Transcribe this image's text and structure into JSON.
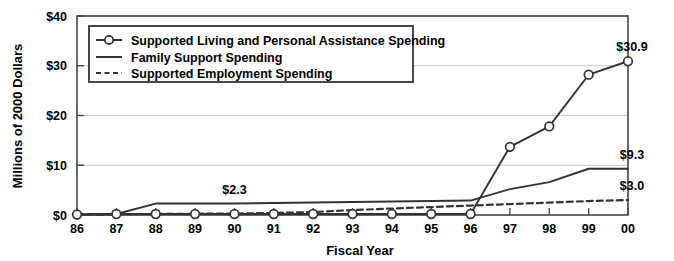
{
  "chart_data": {
    "type": "line",
    "title": "",
    "xlabel": "Fiscal Year",
    "ylabel": "Millions of 2000 Dollars",
    "categories": [
      "86",
      "87",
      "88",
      "89",
      "90",
      "91",
      "92",
      "93",
      "94",
      "95",
      "96",
      "97",
      "98",
      "99",
      "00"
    ],
    "x_tick_labels": [
      "86",
      "87",
      "88",
      "89",
      "90",
      "91",
      "92",
      "93",
      "94",
      "95",
      "96",
      "97",
      "98",
      "99",
      "00"
    ],
    "y_tick_labels": [
      "$0",
      "$10",
      "$20",
      "$30",
      "$40"
    ],
    "y_tick_values": [
      0,
      10,
      20,
      30,
      40
    ],
    "ylim": [
      0,
      40
    ],
    "grid": "horizontal",
    "legend_position": "top-left-inside",
    "series": [
      {
        "name": "Supported Living and Personal Assistance Spending",
        "style": "solid-with-circle-markers",
        "color": "#333333",
        "values": [
          0.1,
          0.2,
          0.2,
          0.2,
          0.2,
          0.2,
          0.2,
          0.2,
          0.2,
          0.2,
          0.2,
          13.7,
          17.8,
          28.2,
          30.9
        ]
      },
      {
        "name": "Family Support Spending",
        "style": "solid",
        "color": "#333333",
        "values": [
          0.1,
          0.2,
          2.3,
          2.3,
          2.3,
          2.4,
          2.5,
          2.6,
          2.7,
          2.8,
          2.9,
          5.2,
          6.6,
          9.3,
          9.3
        ]
      },
      {
        "name": "Supported Employment Spending",
        "style": "dashed",
        "color": "#333333",
        "values": [
          0.1,
          0.15,
          0.2,
          0.25,
          0.3,
          0.4,
          0.6,
          1.0,
          1.3,
          1.6,
          1.9,
          2.2,
          2.5,
          2.8,
          3.0
        ]
      }
    ],
    "annotations": [
      {
        "text": "$2.3",
        "series": "Family Support Spending",
        "category": "90",
        "value": 2.3
      },
      {
        "text": "$30.9",
        "series": "Supported Living and Personal Assistance Spending",
        "category": "00",
        "value": 30.9
      },
      {
        "text": "$9.3",
        "series": "Family Support Spending",
        "category": "00",
        "value": 9.3
      },
      {
        "text": "$3.0",
        "series": "Supported Employment Spending",
        "category": "00",
        "value": 3.0
      }
    ]
  },
  "legend": {
    "items": [
      {
        "label": "Supported Living and Personal Assistance Spending",
        "marker": "line-circle-marker-icon"
      },
      {
        "label": "Family Support Spending",
        "marker": "solid-line-icon"
      },
      {
        "label": "Supported Employment Spending",
        "marker": "dashed-line-icon"
      }
    ]
  },
  "axes": {
    "x_title": "Fiscal Year",
    "y_title": "Millions of 2000 Dollars"
  },
  "colors": {
    "line": "#333333",
    "grid": "#c9c9c9",
    "axis": "#444444",
    "marker_fill": "#ffffff",
    "text": "#000000",
    "background": "#ffffff"
  }
}
